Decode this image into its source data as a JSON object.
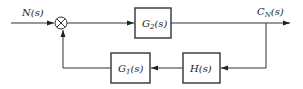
{
  "diagram": {
    "type": "control-system-block-diagram",
    "input": {
      "label": "N(s)",
      "main": "N",
      "arg": "(s)"
    },
    "output": {
      "label": "C_N(s)",
      "main": "C",
      "sub": "N",
      "arg": "(s)"
    },
    "summing_junction": {
      "symbol": "⊗"
    },
    "blocks": [
      {
        "id": "G2",
        "label": "G2(s)",
        "main": "G",
        "sub": "2",
        "arg": "(s)",
        "path": "forward"
      },
      {
        "id": "H",
        "label": "H(s)",
        "main": "H",
        "sub": "",
        "arg": "(s)",
        "path": "feedback"
      },
      {
        "id": "G1",
        "label": "G1(s)",
        "main": "G",
        "sub": "1",
        "arg": "(s)",
        "path": "feedback"
      }
    ],
    "connections": [
      {
        "from": "N(s)",
        "to": "summing_junction"
      },
      {
        "from": "summing_junction",
        "to": "G2"
      },
      {
        "from": "G2",
        "to": "C_N(s)"
      },
      {
        "from": "C_N(s)",
        "to": "H"
      },
      {
        "from": "H",
        "to": "G1"
      },
      {
        "from": "G1",
        "to": "summing_junction"
      }
    ],
    "colors": {
      "stroke": "#333333",
      "background": "#ffffff"
    }
  }
}
